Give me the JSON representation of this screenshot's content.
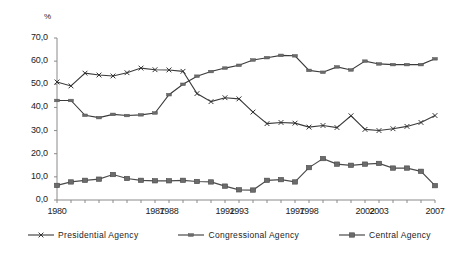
{
  "chart_data": {
    "type": "line",
    "title": "",
    "xlabel": "",
    "ylabel": "%",
    "ylim": [
      0,
      70
    ],
    "xlim": [
      1980,
      2007
    ],
    "grid": false,
    "legend_position": "bottom",
    "ytick_labels": [
      "70,0",
      "60,0",
      "50,0",
      "40,0",
      "30,0",
      "20,0",
      "10,0",
      "0,0"
    ],
    "ytick_values": [
      70,
      60,
      50,
      40,
      30,
      20,
      10,
      0
    ],
    "xtick_labels": [
      "1980",
      "1987",
      "1988",
      "1992",
      "1993",
      "1997",
      "1998",
      "2002",
      "2003",
      "2007"
    ],
    "xtick_values": [
      1980,
      1987,
      1988,
      1992,
      1993,
      1997,
      1998,
      2002,
      2003,
      2007
    ],
    "x": [
      1980,
      1981,
      1982,
      1983,
      1984,
      1985,
      1986,
      1987,
      1988,
      1989,
      1990,
      1991,
      1992,
      1993,
      1994,
      1995,
      1996,
      1997,
      1998,
      1999,
      2000,
      2001,
      2002,
      2003,
      2004,
      2005,
      2006,
      2007
    ],
    "series": [
      {
        "name": "Presidential Agency",
        "marker": "x",
        "values": [
          51.0,
          49.3,
          54.8,
          54.0,
          53.6,
          55.0,
          57.0,
          56.3,
          56.2,
          55.6,
          46.0,
          42.5,
          44.2,
          43.7,
          38.0,
          33.0,
          33.5,
          33.2,
          31.5,
          32.2,
          31.3,
          36.4,
          30.5,
          30.0,
          30.8,
          31.8,
          33.5,
          36.5
        ]
      },
      {
        "name": "Congressional Agency",
        "marker": "dash",
        "values": [
          43.0,
          43.0,
          36.6,
          35.6,
          37.0,
          36.5,
          36.8,
          37.6,
          45.5,
          50.0,
          53.5,
          55.5,
          57.0,
          58.2,
          60.5,
          61.5,
          62.5,
          62.3,
          56.0,
          55.2,
          57.5,
          56.2,
          60.0,
          58.8,
          58.5,
          58.5,
          58.5,
          61.0
        ]
      },
      {
        "name": "Central Agency",
        "marker": "square",
        "values": [
          6.3,
          7.8,
          8.5,
          9.0,
          11.0,
          9.3,
          8.5,
          8.3,
          8.3,
          8.5,
          8.0,
          7.8,
          6.0,
          4.4,
          4.3,
          8.5,
          8.8,
          7.8,
          14.0,
          17.9,
          15.5,
          15.0,
          15.5,
          15.8,
          13.8,
          13.8,
          12.4,
          6.2
        ]
      }
    ]
  },
  "legend": {
    "items": [
      {
        "label": "Presidential Agency"
      },
      {
        "label": "Congressional Agency"
      },
      {
        "label": "Central Agency"
      }
    ]
  }
}
